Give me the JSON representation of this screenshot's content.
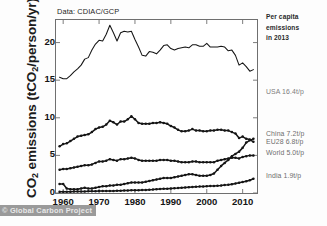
{
  "figure": {
    "source_note": "Data: CDIAC/GCP",
    "watermark": "© Global Carbon Project",
    "ylabel_prefix": "CO",
    "ylabel_sub": "2",
    "ylabel_suffix": " emissions (tCO",
    "ylabel_sub2": "2",
    "ylabel_tail": "/person/yr)"
  },
  "legend": {
    "header_line1": "Per capita",
    "header_line2": "emissions",
    "header_line3": "in 2013",
    "entries": [
      {
        "label": "USA 16.4t/p",
        "top": 88,
        "color": "#7d7d7d"
      },
      {
        "label": "China 7.2t/p",
        "top": 130,
        "color": "#6e6e6e"
      },
      {
        "label": "EU28 6.8t/p",
        "top": 138,
        "color": "#6e6e6e"
      },
      {
        "label": "World 5.0t/p",
        "top": 149,
        "color": "#6e6e6e"
      },
      {
        "label": "India 1.9t/p",
        "top": 172,
        "color": "#6e6e6e"
      }
    ]
  },
  "axes": {
    "yticks": [
      {
        "value": 0,
        "label": "0"
      },
      {
        "value": 5,
        "label": "5"
      },
      {
        "value": 10,
        "label": "10"
      },
      {
        "value": 15,
        "label": "15"
      },
      {
        "value": 20,
        "label": "20"
      }
    ],
    "xticks": [
      {
        "value": 1960,
        "label": "1960"
      },
      {
        "value": 1970,
        "label": "1970"
      },
      {
        "value": 1980,
        "label": "1980"
      },
      {
        "value": 1990,
        "label": "1990"
      },
      {
        "value": 2000,
        "label": "2000"
      },
      {
        "value": 2010,
        "label": "2010"
      }
    ]
  },
  "chart_data": {
    "type": "line",
    "title": "",
    "subtitle": "",
    "xlabel": "",
    "ylabel": "CO2 emissions (tCO2/person/yr)",
    "xlim": [
      1958,
      2014
    ],
    "ylim": [
      0,
      23
    ],
    "grid": false,
    "legend_position": "right",
    "annotation": "Per capita emissions in 2013",
    "source": "Data: CDIAC/GCP",
    "x": [
      1959,
      1960,
      1961,
      1962,
      1963,
      1964,
      1965,
      1966,
      1967,
      1968,
      1969,
      1970,
      1971,
      1972,
      1973,
      1974,
      1975,
      1976,
      1977,
      1978,
      1979,
      1980,
      1981,
      1982,
      1983,
      1984,
      1985,
      1986,
      1987,
      1988,
      1989,
      1990,
      1991,
      1992,
      1993,
      1994,
      1995,
      1996,
      1997,
      1998,
      1999,
      2000,
      2001,
      2002,
      2003,
      2004,
      2005,
      2006,
      2007,
      2008,
      2009,
      2010,
      2011,
      2012,
      2013
    ],
    "series": [
      {
        "name": "USA",
        "final_value": 16.4,
        "final_label": "USA 16.4t/p",
        "marker": false,
        "values": [
          15.4,
          15.2,
          15.2,
          15.6,
          16.1,
          16.5,
          17.0,
          17.8,
          18.0,
          19.0,
          19.8,
          20.3,
          20.2,
          21.1,
          22.3,
          21.3,
          20.2,
          21.3,
          21.5,
          21.4,
          21.5,
          20.4,
          19.4,
          18.3,
          18.2,
          18.8,
          18.7,
          18.5,
          19.0,
          19.6,
          19.7,
          19.2,
          19.0,
          19.2,
          19.3,
          19.4,
          19.3,
          19.7,
          19.7,
          19.5,
          19.5,
          19.9,
          19.4,
          19.4,
          19.4,
          19.5,
          19.4,
          18.9,
          19.0,
          18.3,
          17.0,
          17.3,
          16.8,
          16.2,
          16.4
        ]
      },
      {
        "name": "EU28",
        "final_value": 6.8,
        "final_label": "EU28 6.8t/p",
        "marker": true,
        "values": [
          6.2,
          6.5,
          6.6,
          6.9,
          7.2,
          7.5,
          7.6,
          7.7,
          7.8,
          8.1,
          8.5,
          8.7,
          8.8,
          9.1,
          9.6,
          9.4,
          9.1,
          9.5,
          9.5,
          9.8,
          10.2,
          9.8,
          9.3,
          9.2,
          9.2,
          9.2,
          9.3,
          9.3,
          9.4,
          9.3,
          9.2,
          8.9,
          8.7,
          8.4,
          8.2,
          8.2,
          8.3,
          8.5,
          8.3,
          8.3,
          8.2,
          8.2,
          8.3,
          8.3,
          8.4,
          8.4,
          8.3,
          8.3,
          8.1,
          7.9,
          7.3,
          7.5,
          7.2,
          7.1,
          6.8
        ]
      },
      {
        "name": "World",
        "final_value": 5.0,
        "final_label": "World 5.0t/p",
        "marker": true,
        "values": [
          3.1,
          3.2,
          3.2,
          3.3,
          3.4,
          3.5,
          3.6,
          3.7,
          3.7,
          3.8,
          4.0,
          4.2,
          4.2,
          4.3,
          4.5,
          4.4,
          4.3,
          4.5,
          4.5,
          4.6,
          4.7,
          4.6,
          4.4,
          4.3,
          4.3,
          4.3,
          4.3,
          4.3,
          4.4,
          4.4,
          4.4,
          4.3,
          4.3,
          4.2,
          4.1,
          4.1,
          4.1,
          4.2,
          4.2,
          4.1,
          4.1,
          4.1,
          4.1,
          4.1,
          4.3,
          4.4,
          4.5,
          4.6,
          4.7,
          4.7,
          4.6,
          4.8,
          4.9,
          5.0,
          5.0
        ]
      },
      {
        "name": "China",
        "final_value": 7.2,
        "final_label": "China 7.2t/p",
        "marker": true,
        "values": [
          1.2,
          1.2,
          0.6,
          0.5,
          0.5,
          0.5,
          0.6,
          0.7,
          0.6,
          0.6,
          0.7,
          0.8,
          0.9,
          0.9,
          1.0,
          1.0,
          1.1,
          1.1,
          1.2,
          1.3,
          1.4,
          1.4,
          1.4,
          1.4,
          1.5,
          1.6,
          1.7,
          1.8,
          1.9,
          2.0,
          2.0,
          2.0,
          2.1,
          2.2,
          2.3,
          2.4,
          2.5,
          2.5,
          2.4,
          2.3,
          2.3,
          2.3,
          2.4,
          2.6,
          3.1,
          3.6,
          4.0,
          4.4,
          4.9,
          5.2,
          5.5,
          6.0,
          6.7,
          7.0,
          7.2
        ]
      },
      {
        "name": "India",
        "final_value": 1.9,
        "final_label": "India 1.9t/p",
        "marker": true,
        "values": [
          0.15,
          0.16,
          0.17,
          0.18,
          0.19,
          0.2,
          0.21,
          0.21,
          0.22,
          0.23,
          0.24,
          0.25,
          0.26,
          0.27,
          0.27,
          0.28,
          0.3,
          0.31,
          0.33,
          0.34,
          0.35,
          0.36,
          0.38,
          0.4,
          0.41,
          0.44,
          0.46,
          0.49,
          0.52,
          0.55,
          0.58,
          0.61,
          0.64,
          0.66,
          0.69,
          0.73,
          0.77,
          0.8,
          0.83,
          0.85,
          0.88,
          0.9,
          0.92,
          0.94,
          0.97,
          1.0,
          1.05,
          1.1,
          1.17,
          1.25,
          1.35,
          1.45,
          1.55,
          1.7,
          1.9
        ]
      }
    ]
  }
}
